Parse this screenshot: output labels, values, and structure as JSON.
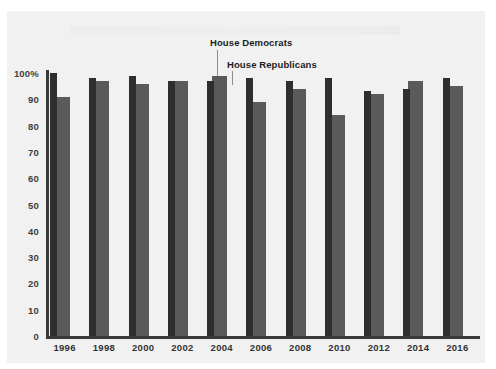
{
  "chart_data": {
    "type": "bar",
    "title": "",
    "xlabel": "",
    "ylabel": "",
    "ylim": [
      0,
      100
    ],
    "grid": false,
    "legend_position": "inline-annotation",
    "categories": [
      "1996",
      "1998",
      "2000",
      "2002",
      "2004",
      "2006",
      "2008",
      "2010",
      "2012",
      "2014",
      "2016"
    ],
    "yticks": [
      "0",
      "10",
      "20",
      "30",
      "40",
      "50",
      "60",
      "70",
      "80",
      "90",
      "100%"
    ],
    "ytick_values": [
      0,
      10,
      20,
      30,
      40,
      50,
      60,
      70,
      80,
      90,
      100
    ],
    "series": [
      {
        "name": "House Democrats",
        "color": "#2e2e2e",
        "values": [
          100,
          98,
          99,
          97,
          97,
          98,
          97,
          98,
          93,
          94,
          98
        ]
      },
      {
        "name": "House Republicans",
        "color": "#5a5a5a",
        "values": [
          91,
          97,
          96,
          97,
          99,
          89,
          94,
          84,
          92,
          97,
          95
        ]
      }
    ],
    "annotations": [
      {
        "text": "House Democrats",
        "target_series": "House Democrats",
        "target_category": "2004"
      },
      {
        "text": "House Republicans",
        "target_series": "House Republicans",
        "target_category": "2004"
      }
    ]
  },
  "colors": {
    "page_background": "#ffffff",
    "panel_background": "#f1f1f1",
    "axis": "#3a3a3a",
    "democrat_bar": "#2e2e2e",
    "republican_bar": "#5a5a5a",
    "label_text": "#333333",
    "annotation_text": "#1d1d1d",
    "leader_line": "#8d8d8d"
  }
}
